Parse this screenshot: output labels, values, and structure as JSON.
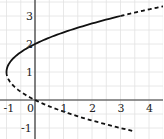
{
  "chart_data": {
    "type": "line",
    "title": "",
    "xlabel": "",
    "ylabel": "",
    "equation": "x = y^2 - 2y",
    "xlim": [
      -1.2,
      4.4
    ],
    "ylim": [
      -1.3,
      3.5
    ],
    "grid": true,
    "x_ticks": [
      "-1",
      "0",
      "1",
      "2",
      "3",
      "4"
    ],
    "y_ticks": [
      "-1",
      "1",
      "2",
      "3"
    ],
    "series": [
      {
        "name": "solid branch",
        "style": "solid",
        "points": [
          [
            -1,
            1
          ],
          [
            -0.75,
            1.5
          ],
          [
            0,
            2
          ],
          [
            1.25,
            2.5
          ],
          [
            3,
            3
          ]
        ]
      },
      {
        "name": "upper dashed extension",
        "style": "dashed",
        "points": [
          [
            3,
            3
          ],
          [
            3.6,
            3.17
          ],
          [
            4.4,
            3.36
          ]
        ]
      },
      {
        "name": "lower dashed branch",
        "style": "dashed",
        "points": [
          [
            -1,
            1
          ],
          [
            -0.75,
            0.5
          ],
          [
            0,
            0
          ],
          [
            1.25,
            -0.5
          ],
          [
            3,
            -1
          ],
          [
            3.41,
            -1.1
          ]
        ]
      }
    ],
    "colors": {
      "curve": "#111111",
      "axis": "#333333",
      "grid": "#e2e2e2"
    }
  }
}
